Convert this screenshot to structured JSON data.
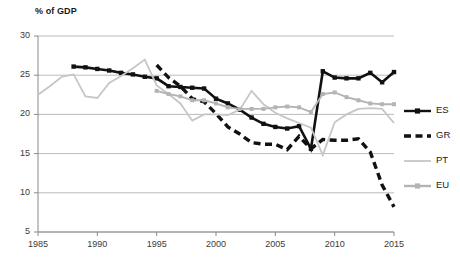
{
  "chart_data": {
    "type": "line",
    "title": "",
    "subtitle": "",
    "ylabel": "% of GDP",
    "xlabel": "",
    "xlim": [
      1985,
      2015
    ],
    "ylim": [
      5,
      30
    ],
    "ytick_labels": [
      "30",
      "25",
      "20",
      "15",
      "10",
      "5"
    ],
    "ytick_values": [
      30,
      25,
      20,
      15,
      10,
      5
    ],
    "xtick_labels": [
      "1985",
      "1990",
      "1995",
      "2000",
      "2005",
      "2010",
      "2015"
    ],
    "xtick_values": [
      1985,
      1990,
      1995,
      2000,
      2005,
      2010,
      2015
    ],
    "grid": "horizontal",
    "legend_position": "right",
    "series": [
      {
        "name": "ES",
        "color": "#111111",
        "style": "solid-marker",
        "marker": "square",
        "x": [
          1988,
          1989,
          1990,
          1991,
          1992,
          1993,
          1994,
          1995,
          1996,
          1997,
          1998,
          1999,
          2000,
          2001,
          2002,
          2003,
          2004,
          2005,
          2006,
          2007,
          2008,
          2009,
          2010,
          2011,
          2012,
          2013,
          2014,
          2015
        ],
        "values": [
          26.1,
          26.0,
          25.8,
          25.6,
          25.3,
          25.1,
          24.8,
          24.6,
          23.6,
          23.5,
          23.4,
          23.3,
          22.0,
          21.4,
          20.6,
          19.6,
          18.8,
          18.4,
          18.2,
          18.5,
          15.6,
          25.5,
          24.7,
          24.6,
          24.6,
          25.3,
          24.1,
          25.4
        ]
      },
      {
        "name": "GR",
        "color": "#111111",
        "style": "dashed",
        "marker": "none",
        "x": [
          1995,
          1996,
          1997,
          1998,
          1999,
          2000,
          2001,
          2002,
          2003,
          2004,
          2005,
          2006,
          2007,
          2008,
          2009,
          2010,
          2011,
          2012,
          2013,
          2014,
          2015
        ],
        "values": [
          26.3,
          24.7,
          23.6,
          22.0,
          21.6,
          20.1,
          18.4,
          17.5,
          16.4,
          16.2,
          16.2,
          15.5,
          17.2,
          15.6,
          16.8,
          16.7,
          16.7,
          16.9,
          15.2,
          11.0,
          8.2
        ]
      },
      {
        "name": "PT",
        "color": "#c6c6c6",
        "style": "solid",
        "marker": "none",
        "x": [
          1985,
          1986,
          1987,
          1988,
          1989,
          1990,
          1991,
          1992,
          1993,
          1994,
          1995,
          1996,
          1997,
          1998,
          1999,
          2000,
          2001,
          2002,
          2003,
          2004,
          2005,
          2006,
          2007,
          2008,
          2009,
          2010,
          2011,
          2012,
          2013,
          2014,
          2015
        ],
        "values": [
          22.5,
          23.6,
          24.8,
          25.1,
          22.3,
          22.1,
          24.0,
          24.9,
          25.9,
          27.0,
          23.7,
          22.6,
          21.4,
          19.2,
          20.0,
          20.0,
          19.9,
          20.6,
          23.0,
          21.3,
          20.2,
          19.5,
          18.9,
          18.3,
          14.8,
          19.0,
          20.0,
          20.7,
          20.8,
          20.7,
          18.9
        ]
      },
      {
        "name": "EU",
        "color": "#b4b4b4",
        "style": "solid-marker",
        "marker": "square",
        "x": [
          1995,
          1996,
          1997,
          1998,
          1999,
          2000,
          2001,
          2002,
          2003,
          2004,
          2005,
          2006,
          2007,
          2008,
          2009,
          2010,
          2011,
          2012,
          2013,
          2014,
          2015
        ],
        "values": [
          23.0,
          22.6,
          22.3,
          21.8,
          21.8,
          21.4,
          20.9,
          20.7,
          20.7,
          20.7,
          20.9,
          21.0,
          20.9,
          20.3,
          22.6,
          22.8,
          22.2,
          21.8,
          21.4,
          21.3,
          21.3
        ]
      }
    ]
  },
  "legend": {
    "entries": [
      {
        "label": "ES"
      },
      {
        "label": "GR"
      },
      {
        "label": "PT"
      },
      {
        "label": "EU"
      }
    ]
  }
}
